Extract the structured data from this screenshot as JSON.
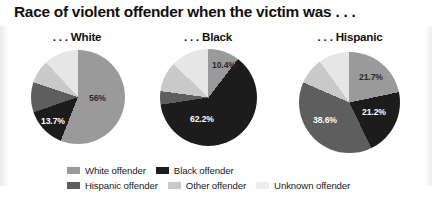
{
  "chart_data": {
    "type": "pie",
    "title": "Race of violent offender when the victim was . . .",
    "legend_position": "bottom",
    "categories": [
      "White offender",
      "Black offender",
      "Hispanic offender",
      "Other offender",
      "Unknown offender"
    ],
    "colors": {
      "white_offender": "#9a9a9a",
      "black_offender": "#1c1c1c",
      "hispanic_offender": "#5e5e5e",
      "other_offender": "#c9c9c9",
      "unknown_offender": "#e6e6e6"
    },
    "panels": [
      {
        "subtitle": ". . . White",
        "slices": [
          {
            "name": "White offender",
            "value": 56.0,
            "label": "56%",
            "label_shown": true,
            "color": "#9a9a9a"
          },
          {
            "name": "Black offender",
            "value": 13.7,
            "label": "13.7%",
            "label_shown": true,
            "color": "#1c1c1c"
          },
          {
            "name": "Hispanic offender",
            "value": 10.4,
            "label": "",
            "label_shown": false,
            "color": "#5e5e5e"
          },
          {
            "name": "Other offender",
            "value": 8.0,
            "label": "",
            "label_shown": false,
            "color": "#c9c9c9"
          },
          {
            "name": "Unknown offender",
            "value": 11.9,
            "label": "",
            "label_shown": false,
            "color": "#e6e6e6"
          }
        ]
      },
      {
        "subtitle": ". . . Black",
        "slices": [
          {
            "name": "White offender",
            "value": 10.4,
            "label": "10.4%",
            "label_shown": true,
            "color": "#9a9a9a"
          },
          {
            "name": "Black offender",
            "value": 62.2,
            "label": "62.2%",
            "label_shown": true,
            "color": "#1c1c1c"
          },
          {
            "name": "Hispanic offender",
            "value": 4.5,
            "label": "",
            "label_shown": false,
            "color": "#5e5e5e"
          },
          {
            "name": "Other offender",
            "value": 10.0,
            "label": "",
            "label_shown": false,
            "color": "#c9c9c9"
          },
          {
            "name": "Unknown offender",
            "value": 12.9,
            "label": "",
            "label_shown": false,
            "color": "#e6e6e6"
          }
        ]
      },
      {
        "subtitle": ". . . Hispanic",
        "slices": [
          {
            "name": "White offender",
            "value": 21.7,
            "label": "21.7%",
            "label_shown": true,
            "color": "#9a9a9a"
          },
          {
            "name": "Black offender",
            "value": 21.2,
            "label": "21.2%",
            "label_shown": true,
            "color": "#1c1c1c"
          },
          {
            "name": "Hispanic offender",
            "value": 38.6,
            "label": "38.6%",
            "label_shown": true,
            "color": "#5e5e5e"
          },
          {
            "name": "Other offender",
            "value": 8.5,
            "label": "",
            "label_shown": false,
            "color": "#c9c9c9"
          },
          {
            "name": "Unknown offender",
            "value": 10.0,
            "label": "",
            "label_shown": false,
            "color": "#e6e6e6"
          }
        ]
      }
    ]
  },
  "legend": {
    "row1": [
      {
        "label": "White offender",
        "color": "#9a9a9a"
      },
      {
        "label": "Black offender",
        "color": "#1c1c1c"
      }
    ],
    "row2": [
      {
        "label": "Hispanic offender",
        "color": "#5e5e5e"
      },
      {
        "label": "Other offender",
        "color": "#c9c9c9"
      },
      {
        "label": "Unknown offender",
        "color": "#ededed"
      }
    ]
  }
}
